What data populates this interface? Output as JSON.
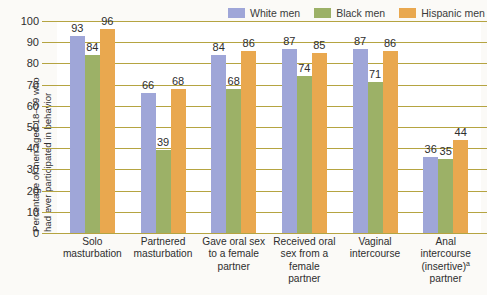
{
  "chart_data": {
    "type": "bar",
    "title": "",
    "xlabel": "",
    "ylabel": "Percentage of men aged 18–39 who had ever participated in behavior",
    "ylabel_lines": [
      "Percentage of men aged 18–39 who",
      "had ever participated in behavior"
    ],
    "ylim": [
      0,
      100
    ],
    "yticks": [
      100,
      90,
      80,
      70,
      60,
      50,
      40,
      30,
      20,
      10,
      0
    ],
    "grid": true,
    "legend_position": "top-right",
    "categories": [
      "Solo masturbation",
      "Partnered masturbation",
      "Gave oral sex to a female partner",
      "Received oral sex from a female partner",
      "Vaginal intercourse",
      "Anal intercourse (insertive)ᵃ partner"
    ],
    "category_lines": [
      [
        "Solo",
        "masturbation"
      ],
      [
        "Partnered",
        "masturbation"
      ],
      [
        "Gave oral sex",
        "to a female",
        "partner"
      ],
      [
        "Received oral",
        "sex from a",
        "female",
        "partner"
      ],
      [
        "Vaginal",
        "intercourse"
      ],
      [
        "Anal",
        "intercourse",
        "(insertive)",
        "partner"
      ]
    ],
    "series": [
      {
        "name": "White men",
        "color": "#9fa6d8",
        "values": [
          93,
          66,
          84,
          87,
          87,
          36
        ]
      },
      {
        "name": "Black men",
        "color": "#9cb167",
        "values": [
          84,
          39,
          68,
          74,
          71,
          35
        ]
      },
      {
        "name": "Hispanic men",
        "color": "#e9a84f",
        "values": [
          96,
          68,
          86,
          85,
          86,
          44
        ]
      }
    ],
    "footnote_marker": "a",
    "colors": {
      "gridline": "#b5a441",
      "plot_background": "#ffffff",
      "page_background": "#fbfaf7",
      "text": "#2e2e2e"
    }
  }
}
